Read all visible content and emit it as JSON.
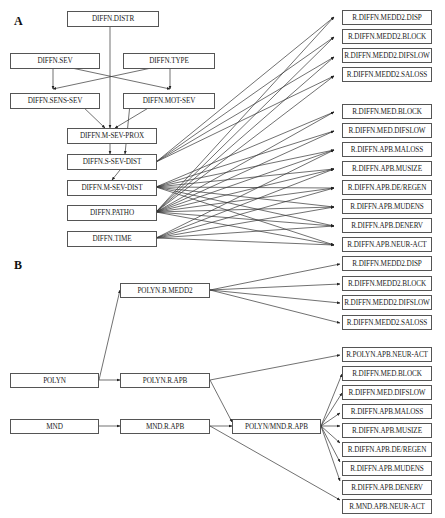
{
  "panels": [
    {
      "label": "A"
    },
    {
      "label": "B"
    }
  ],
  "nodes": {
    "a_distr": "DIFFN.DISTR",
    "a_sev": "DIFFN.SEV",
    "a_type": "DIFFN.TYPE",
    "a_sens_sev": "DIFFN.SENS-SEV",
    "a_mot_sev": "DIFFN.MOT-SEV",
    "a_m_sev_prox": "DIFFN.M-SEV-PROX",
    "a_s_sev_dist": "DIFFN.S-SEV-DIST",
    "a_m_sev_dist": "DIFFN.M-SEV-DIST",
    "a_patho": "DIFFN.PATHO",
    "a_time": "DIFFN.TIME",
    "a_r1": "R.DIFFN.MEDD2.DISP",
    "a_r2": "R.DIFFN.MEDD2.BLOCK",
    "a_r3": "R.DIFFN.MEDD2.DIFSLOW",
    "a_r4": "R.DIFFN.MEDD2.SALOSS",
    "a_r5": "R.DIFFN.MED.BLOCK",
    "a_r6": "R.DIFFN.MED.DIFSLOW",
    "a_r7": "R.DIFFN.APB.MALOSS",
    "a_r8": "R.DIFFN.APB.MUSIZE",
    "a_r9": "R.DIFFN.APB.DE/REGEN",
    "a_r10": "R.DIFFN.APB.MUDENS",
    "a_r11": "R.DIFFN.APB.DENERV",
    "a_r12": "R.DIFFN.APB.NEUR-ACT",
    "b_polyn": "POLYN",
    "b_mnd": "MND",
    "b_polyn_medd2": "POLYN.R.MEDD2",
    "b_polyn_apb": "POLYN.R.APB",
    "b_mnd_apb": "MND.R.APB",
    "b_polyn_mnd_apb": "POLYN/MND.R.APB",
    "b_r1": "R.DIFFN.MEDD2.DISP",
    "b_r2": "R.DIFFN.MEDD2.BLOCK",
    "b_r3": "R.DIFFN.MEDD2.DIFSLOW",
    "b_r4": "R.DIFFN.MEDD2.SALOSS",
    "b_r5": "R.POLYN.APB.NEUR-ACT",
    "b_r6": "R.DIFFN.MED.BLOCK",
    "b_r7": "R.DIFFN.MED.DIFSLOW",
    "b_r8": "R.DIFFN.APB.MALOSS",
    "b_r9": "R.DIFFN.APB.MUSIZE",
    "b_r10": "R.DIFFN.APB.DE/REGEN",
    "b_r11": "R.DIFFN.APB.MUDENS",
    "b_r12": "R.DIFFN.APB.DENERV",
    "b_r13": "R.MND.APB.NEUR-ACT"
  }
}
